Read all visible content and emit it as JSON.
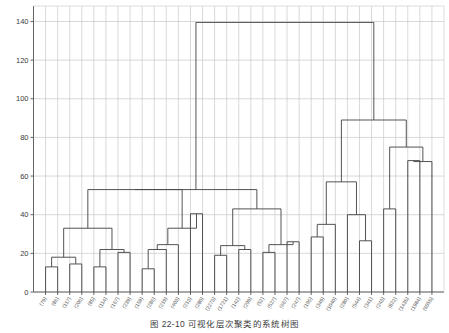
{
  "caption": {
    "figure_number": "图 22-10",
    "text": "可视化层次聚类的系统树图",
    "full": "图 22-10    可视化层次聚类的系统树图"
  },
  "chart_data": {
    "type": "line",
    "chart_kind": "dendrogram",
    "title": "",
    "xlabel": "",
    "ylabel": "",
    "ylim": [
      0,
      148
    ],
    "xlim": [
      0,
      40
    ],
    "grid": true,
    "grid_color": "#c9c9c9",
    "line_color": "#4a4a4a",
    "background": "#ffffff",
    "yticks": [
      0,
      20,
      40,
      60,
      80,
      100,
      120,
      140
    ],
    "ytick_labels": [
      "0",
      "20",
      "40",
      "60",
      "80",
      "100",
      "120",
      "140"
    ],
    "leaf_labels": [
      "(79)",
      "(86)",
      "(117)",
      "(206)",
      "(85)",
      "(114)",
      "(167)",
      "(239)",
      "(159)",
      "(286)",
      "(219)",
      "(403)",
      "(213)",
      "(280)",
      "(2273)",
      "(1721)",
      "(142)",
      "(299)",
      "(52)",
      "(527)",
      "(667)",
      "(247)",
      "(196)",
      "(349)",
      "(1040)",
      "(280)",
      "(544)",
      "(341)",
      "(243)",
      "(822)",
      "(1435)",
      "(1984)",
      "(6055)"
    ],
    "leaf_heights": [
      13,
      13,
      14.5,
      14.5,
      13,
      13,
      22,
      22,
      12,
      12,
      22,
      22,
      40.5,
      40.5,
      19,
      19,
      22,
      22,
      20.5,
      20.5,
      26,
      26,
      28.5,
      28.5,
      35,
      40,
      26.5,
      26.5,
      43,
      43,
      68,
      68,
      67.5
    ],
    "merges": [
      {
        "id": "m1",
        "height": 13,
        "left_x": 1,
        "right_x": 2,
        "note": "(79)+(86)"
      },
      {
        "id": "m2",
        "height": 14.5,
        "left_x": 3,
        "right_x": 4,
        "note": "(117)+(206)"
      },
      {
        "id": "m3",
        "height": 18,
        "left_x": 1.5,
        "right_x": 3.5,
        "note": "m1+m2"
      },
      {
        "id": "m4",
        "height": 13,
        "left_x": 5,
        "right_x": 6,
        "note": "(85)+(114)"
      },
      {
        "id": "m5",
        "height": 20.5,
        "left_x": 7,
        "right_x": 8,
        "note": "(167)+(239)"
      },
      {
        "id": "m6",
        "height": 22,
        "left_x": 5.5,
        "right_x": 7.5,
        "note": "m4+m5"
      },
      {
        "id": "m7",
        "height": 33,
        "left_x": 2.5,
        "right_x": 6.5,
        "note": "m3+m6"
      },
      {
        "id": "m8",
        "height": 12,
        "left_x": 9,
        "right_x": 10,
        "note": "(159)+(286)"
      },
      {
        "id": "m9",
        "height": 22,
        "left_x": 9.5,
        "right_x": 11,
        "note": "m8+(219)"
      },
      {
        "id": "m10",
        "height": 24.5,
        "left_x": 10.25,
        "right_x": 12,
        "note": "m9+(403)"
      },
      {
        "id": "m11",
        "height": 40.5,
        "left_x": 13,
        "right_x": 14,
        "note": "(213)+(280)"
      },
      {
        "id": "m12",
        "height": 33,
        "left_x": 11.1,
        "right_x": 13.5,
        "note": "m10+m11"
      },
      {
        "id": "m13",
        "height": 53,
        "left_x": 4.5,
        "right_x": 12.3,
        "note": "m7+m12"
      },
      {
        "id": "m14",
        "height": 19,
        "left_x": 15,
        "right_x": 16,
        "note": "(2273)+(1721)"
      },
      {
        "id": "m15",
        "height": 22,
        "left_x": 17,
        "right_x": 18,
        "note": "(142)+(299)"
      },
      {
        "id": "m16",
        "height": 24,
        "left_x": 15.5,
        "right_x": 17.5,
        "note": "m14+m15"
      },
      {
        "id": "m17",
        "height": 20.5,
        "left_x": 19,
        "right_x": 20,
        "note": "(52)+(527)"
      },
      {
        "id": "m18",
        "height": 26,
        "left_x": 21,
        "right_x": 22,
        "note": "(667)+(247)"
      },
      {
        "id": "m19",
        "height": 24.5,
        "left_x": 19.5,
        "right_x": 21.5,
        "note": "m17+m18"
      },
      {
        "id": "m20",
        "height": 43,
        "left_x": 16.5,
        "right_x": 20.5,
        "note": "m16+m19"
      },
      {
        "id": "m21",
        "height": 28.5,
        "left_x": 23,
        "right_x": 24,
        "note": "(196)+(349)"
      },
      {
        "id": "m22",
        "height": 35,
        "left_x": 23.5,
        "right_x": 25,
        "note": "m21+(1040)"
      },
      {
        "id": "m23",
        "height": 26.5,
        "left_x": 27,
        "right_x": 28,
        "note": "(544)+(341)"
      },
      {
        "id": "m24",
        "height": 40,
        "left_x": 26,
        "right_x": 27.5,
        "note": "(280)+m23"
      },
      {
        "id": "m25",
        "height": 57,
        "left_x": 24.2,
        "right_x": 26.7,
        "note": "m22+m24"
      },
      {
        "id": "m26",
        "height": 43,
        "left_x": 29,
        "right_x": 30,
        "note": "(243)+(822)"
      },
      {
        "id": "m27",
        "height": 68,
        "left_x": 31,
        "right_x": 32,
        "note": "(1435)+(1984)"
      },
      {
        "id": "m28",
        "height": 67.5,
        "left_x": 31.5,
        "right_x": 33,
        "note": "m27+(6055)"
      },
      {
        "id": "m29",
        "height": 75,
        "left_x": 29.5,
        "right_x": 32.2,
        "note": "m26+m28"
      },
      {
        "id": "m30",
        "height": 89,
        "left_x": 25.4,
        "right_x": 30.8,
        "note": "m25+m29"
      },
      {
        "id": "m31",
        "height": 139.5,
        "left_x": 8.4,
        "right_x": 28.1,
        "note": "root: m13/m20 + m30"
      },
      {
        "id": "m32",
        "height": 53,
        "left_x": 8.4,
        "right_x": 18.5,
        "note": "m13+m20 join"
      }
    ]
  }
}
